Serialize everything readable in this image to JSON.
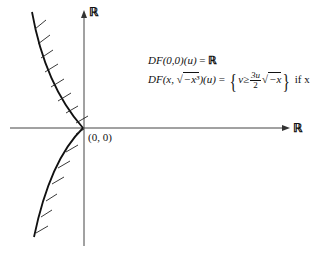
{
  "axes": {
    "x_label": "ℝ",
    "y_label": "ℝ",
    "origin_label": "(0, 0)"
  },
  "equations": {
    "line1": {
      "lhs": "DF(0,0)(u)",
      "eq": "=",
      "rhs": "ℝ"
    },
    "line2": {
      "lhs_func": "DF",
      "lhs_arg_open": "(x, ",
      "lhs_sqrt_content": "−x³",
      "lhs_arg_close": ")(u)",
      "eq": "=",
      "brace_open": "{",
      "set_var": "v",
      "geq": "≥",
      "frac_num": "3u",
      "frac_den": "2",
      "sqrt_content": "−x",
      "brace_close": "}",
      "condition": "if  x < 0"
    }
  },
  "colors": {
    "axis": "#444444",
    "curve": "#111111",
    "text": "#111111"
  }
}
